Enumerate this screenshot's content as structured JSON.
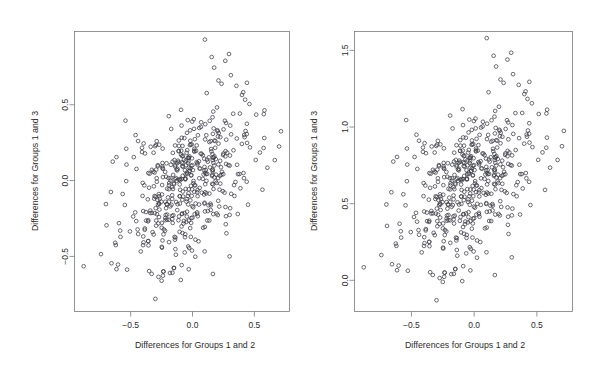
{
  "figure": {
    "background": "#ffffff",
    "point_color": "#3b3b46",
    "axis_color": "#7a7a7a",
    "text_color": "#2b2b2b",
    "panel_count": 2
  },
  "chart_data": [
    {
      "type": "scatter",
      "panel": "left",
      "title": "",
      "xlabel": "Differences for Groups 1 and 2",
      "ylabel": "Differences for Groups 1 and 3",
      "xticks": [
        -0.5,
        0.0,
        0.5
      ],
      "xticklabels": [
        "-0.5",
        "0.0",
        "0.5"
      ],
      "yticks": [
        -0.5,
        0.0,
        0.5
      ],
      "yticklabels": [
        "-0.5",
        "0.0",
        "0.5"
      ],
      "xlim": [
        -0.95,
        0.78
      ],
      "ylim": [
        -0.86,
        0.98
      ],
      "grid": false,
      "legend": null,
      "marker": "open-circle",
      "n_points": 500,
      "correlation": 0.45,
      "x_mean": -0.02,
      "y_mean": -0.02,
      "x_sd": 0.235,
      "y_sd": 0.245
    },
    {
      "type": "scatter",
      "panel": "right",
      "title": "",
      "xlabel": "Differences for Groups 1 and 2",
      "ylabel": "Differences for Groups 1 and 3",
      "xticks": [
        -0.5,
        0.0,
        0.5
      ],
      "xticklabels": [
        "-0.5",
        "0.0",
        "0.5"
      ],
      "yticks": [
        0.0,
        0.5,
        1.0,
        1.5
      ],
      "yticklabels": [
        "0.0",
        "0.5",
        "1.0",
        "1.5"
      ],
      "xlim": [
        -0.95,
        0.78
      ],
      "ylim": [
        -0.2,
        1.62
      ],
      "grid": false,
      "legend": null,
      "marker": "open-circle",
      "n_points": 500,
      "correlation": 0.45,
      "x_mean": -0.02,
      "y_mean": 0.63,
      "x_sd": 0.235,
      "y_sd": 0.245,
      "note": "same x values as left panel; y shifted by +0.65"
    }
  ]
}
